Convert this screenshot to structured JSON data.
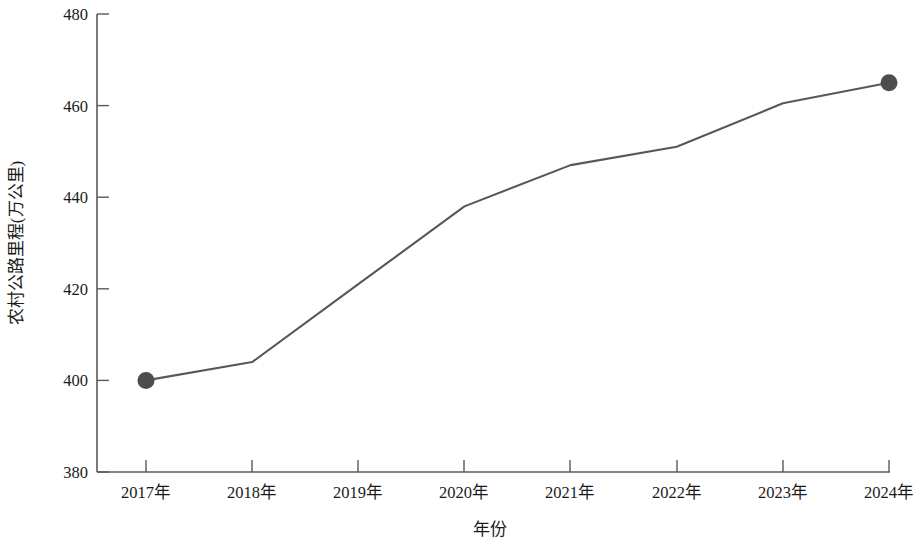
{
  "chart_data": {
    "type": "line",
    "title": "",
    "subtitle": "",
    "xlabel": "年份",
    "ylabel": "农村公路里程(万公里)",
    "categories": [
      "2017年",
      "2018年",
      "2019年",
      "2020年",
      "2021年",
      "2022年",
      "2023年",
      "2024年"
    ],
    "values": [
      400,
      404,
      421,
      438,
      447,
      451,
      460.5,
      465
    ],
    "series": [
      {
        "name": "农村公路里程",
        "values": [
          400,
          404,
          421,
          438,
          447,
          451,
          460.5,
          465
        ]
      }
    ],
    "ylim": [
      380,
      480
    ],
    "y_ticks": [
      380,
      400,
      420,
      440,
      460,
      480
    ],
    "y_tick_labels": [
      "380",
      "400",
      "420",
      "440",
      "460",
      "480"
    ],
    "x_tick_labels": [
      "2017年",
      "2018年",
      "2019年",
      "2020年",
      "2021年",
      "2022年",
      "2023年",
      "2024年"
    ],
    "grid": false,
    "legend": false,
    "legend_position": "none",
    "markers": {
      "shown_at": [
        "2017年",
        "2024年"
      ],
      "shape": "circle"
    },
    "colors": {
      "line": "#585858",
      "marker": "#4d4d4d",
      "axis": "#5a5a5a",
      "text": "#1a1a1a",
      "background": "#ffffff"
    },
    "annotations": []
  }
}
